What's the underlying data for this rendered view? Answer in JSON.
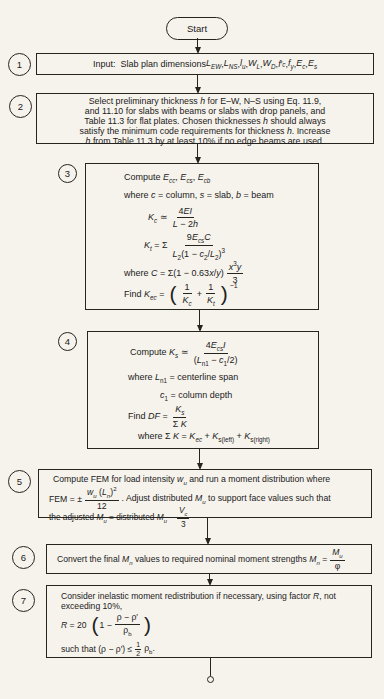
{
  "palette": {
    "paper": "#f6f3ed",
    "ink": "#26241f"
  },
  "start": {
    "label": "Start"
  },
  "s1": {
    "num": "1",
    "text": "Input:&nbsp; Slab plan dimensions <i>L<sub>EW</sub></i>, <i>L<sub>NS</sub></i>, <i>l<sub>u</sub></i>, <i>W<sub>L</sub></i>, <i>W<sub>D</sub></i>, <i>f</i>′<sub><i>c</i></sub>, <i>f<sub>y</sub></i>, <i>E<sub>c</sub></i>, <i>E<sub>s</sub></i>"
  },
  "s2": {
    "num": "2",
    "lines": [
      "Select preliminary thickness <i>h</i> for E–W, N–S using Eq. 11.9,",
      "and 11.10 for slabs with beams or slabs with drop panels, and",
      "Table 11.3 for flat plates. Chosen thicknesses <i>h</i> should always",
      "satisfy the minimum code requirements for thickness <i>h</i>. Increase",
      "<i>h</i> from Table 11.3 by at least 10% if no edge beams are used."
    ]
  },
  "s3": {
    "num": "3",
    "title": "Compute <i>E<sub>cc</sub></i>, <i>E<sub>cs</sub></i>, <i>E<sub>cb</sub></i>",
    "where_line": "where <i>c</i> = column, <i>s</i> = slab, <i>b</i> = beam",
    "kc_lhs": "<i>K<sub>c</sub></i> ≃",
    "kc_num": "4<i>EI</i>",
    "kc_den": "<i>L</i> − 2<i>h</i>",
    "kt_lhs": "<i>K<sub>t</sub></i> = Σ",
    "kt_num": "9<i>E<sub>cs</sub></i><i>C</i>",
    "kt_den": "<i>L</i><sub>2</sub>(1 − <i>c</i><sub>2</sub>/<i>L</i><sub>2</sub>)<sup>3</sup>",
    "c_pre": "where <i>C</i> = Σ(1 − 0.63<i>x</i>/<i>y</i>)",
    "c_num": "<i>x</i><sup>3</sup><i>y</i>",
    "c_den": "3",
    "kec_pre": "Find <i>K<sub>ec</sub></i> =",
    "kec_f1_num": "1",
    "kec_f1_den": "<i>K<sub>c</sub></i>",
    "kec_plus": "+",
    "kec_f2_num": "1",
    "kec_f2_den": "<i>K<sub>t</sub></i>",
    "kec_exp": "−1"
  },
  "s4": {
    "num": "4",
    "ks_lhs": "Compute <i>K<sub>s</sub></i> ≃",
    "ks_num": "4<i>E<sub>cs</sub></i><i>I</i>",
    "ks_den": "(<i>L</i><sub>n1</sub> − <i>c</i><sub>1</sub>/2)",
    "where1": "where <i>L</i><sub>n1</sub> = centerline span",
    "where2": "<i>c</i><sub>1</sub> = column depth",
    "df_pre": "Find <i>DF</i> =",
    "df_num": "<i>K<sub>s</sub></i>",
    "df_den": "Σ <i>K</i>",
    "sum_line": "where Σ <i>K</i> = <i>K<sub>ec</sub></i> + <i>K</i><sub>s(left)</sub> + <i>K</i><sub>s(right)</sub>"
  },
  "s5": {
    "num": "5",
    "line1": "Compute FEM for load intensity <i>w<sub>u</sub></i> and run a moment distribution where",
    "fem_lhs": "FEM = ±",
    "fem_num": "<i>w<sub>u</sub></i> (<i>L<sub>n</sub></i>)<sup>2</sup>",
    "fem_den": "12",
    "fem_post": ". Adjust distributed <i>M<sub>u</sub></i> to support face values such that",
    "adj_pre": "the adjusted <i>M<sub>u</sub></i> = distributed <i>M<sub>u</sub></i> −",
    "adj_num": "<i>V<sub>c</sub></i>",
    "adj_den": "3"
  },
  "s6": {
    "num": "6",
    "pre": "Convert the final <i>M<sub>n</sub></i> values to required nominal moment strengths <i>M<sub>n</sub></i> =",
    "frac_num": "<i>M<sub>u</sub></i>",
    "frac_den": "φ"
  },
  "s7": {
    "num": "7",
    "line1": "Consider inelastic moment redistribution if necessary, using factor <i>R</i>, not",
    "line2": "exceeding 10%,",
    "r_lhs": "<i>R</i> = 20",
    "r_inner_pre": "1 −",
    "r_num": "ρ − ρ′",
    "r_den": "ρ<sub>b</sub>",
    "such_pre": "such that (ρ − ρ′) ≤",
    "half_num": "1",
    "half_den": "2",
    "such_post": "ρ<sub>b</sub>."
  }
}
